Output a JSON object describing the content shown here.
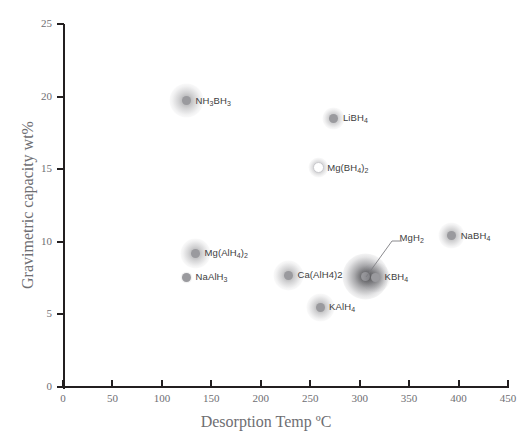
{
  "chart_data": {
    "type": "scatter",
    "title": "",
    "xlabel": "Desorption Temp ºC",
    "ylabel": "Gravimetric capacity wt%",
    "xlim": [
      0,
      450
    ],
    "ylim": [
      0,
      25
    ],
    "xticks": [
      0,
      50,
      100,
      150,
      200,
      250,
      300,
      350,
      400,
      450
    ],
    "yticks": [
      0,
      5,
      10,
      15,
      20,
      25
    ],
    "grid": false,
    "legend": "none",
    "points": [
      {
        "label": "NH3BH3",
        "label_html": "NH<sub>3</sub>BH<sub>3</sub>",
        "x": 125,
        "y": 19.7,
        "marker": "filled",
        "halo": 34,
        "label_side": "right"
      },
      {
        "label": "LiBH4",
        "label_html": "LiBH<sub>4</sub>",
        "x": 274,
        "y": 18.5,
        "marker": "filled",
        "halo": 22,
        "label_side": "right"
      },
      {
        "label": "Mg(BH4)2",
        "label_html": "Mg(BH<sub>4</sub>)<sub>2</sub>",
        "x": 258,
        "y": 15.1,
        "marker": "open",
        "halo": 20,
        "label_side": "right"
      },
      {
        "label": "NaBH4",
        "label_html": "NaBH<sub>4</sub>",
        "x": 393,
        "y": 10.4,
        "marker": "filled",
        "halo": 26,
        "label_side": "right"
      },
      {
        "label": "Mg(AlH4)2",
        "label_html": "Mg(AlH<sub>4</sub>)<sub>2</sub>",
        "x": 134,
        "y": 9.2,
        "marker": "filled",
        "halo": 30,
        "label_side": "right"
      },
      {
        "label": "Ca(AlH4)2",
        "label_html": "Ca(AlH4)2",
        "x": 228,
        "y": 7.7,
        "marker": "filled",
        "halo": 30,
        "label_side": "right"
      },
      {
        "label": "NaAlH3",
        "label_html": "NaAlH<sub>3</sub>",
        "x": 125,
        "y": 7.55,
        "marker": "filled",
        "halo": 12,
        "label_side": "right"
      },
      {
        "label": "MgH2",
        "label_html": "MgH<sub>2</sub>",
        "x": 306,
        "y": 7.6,
        "marker": "filled",
        "halo": 46,
        "label_side": "leader"
      },
      {
        "label": "KBH4",
        "label_html": "KBH<sub>4</sub>",
        "x": 316,
        "y": 7.55,
        "marker": "filled",
        "halo": 30,
        "label_side": "right"
      },
      {
        "label": "KAlH4",
        "label_html": "KAlH<sub>4</sub>",
        "x": 260,
        "y": 5.5,
        "marker": "filled",
        "halo": 28,
        "label_side": "right"
      }
    ],
    "colors": {
      "axis": "#231f20",
      "tick_text": "#6e6e72",
      "axis_title": "#6e6e72",
      "marker_fill": "#9a9a9e",
      "marker_open_ring": "#c9c9cd",
      "point_label": "#3d3d40",
      "background": "#ffffff"
    }
  }
}
